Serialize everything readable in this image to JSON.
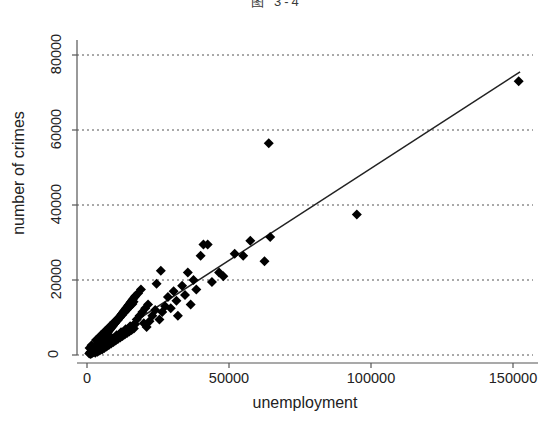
{
  "figure": {
    "title_cropped": "图 3-4",
    "background_color": "#ffffff",
    "marker_color": "#000000",
    "line_color": "#222222",
    "grid_color": "#555555"
  },
  "chart_data": {
    "type": "scatter",
    "title": "图 3-4",
    "xlabel": "unemployment",
    "ylabel": "number of crimes",
    "xlim": [
      -4000,
      160000
    ],
    "ylim": [
      -3500,
      85000
    ],
    "xticks": [
      0,
      50000,
      100000,
      150000
    ],
    "xtick_labels": [
      "0",
      "50000",
      "100000",
      "150000"
    ],
    "yticks": [
      0,
      20000,
      40000,
      60000,
      80000
    ],
    "ytick_labels": [
      "0",
      "20000",
      "40000",
      "60000",
      "80000"
    ],
    "grid": "horizontal-dashed",
    "legend": null,
    "marker": "diamond",
    "marker_size": 5,
    "series": [
      {
        "name": "observations",
        "points": [
          [
            800,
            400
          ],
          [
            1100,
            600
          ],
          [
            1300,
            300
          ],
          [
            1500,
            900
          ],
          [
            1700,
            500
          ],
          [
            1900,
            1200
          ],
          [
            2100,
            700
          ],
          [
            2300,
            1500
          ],
          [
            2500,
            1000
          ],
          [
            2700,
            1800
          ],
          [
            2900,
            600
          ],
          [
            3100,
            2100
          ],
          [
            3300,
            1400
          ],
          [
            3500,
            2400
          ],
          [
            3700,
            900
          ],
          [
            3900,
            2800
          ],
          [
            4100,
            1700
          ],
          [
            4300,
            3100
          ],
          [
            4500,
            1200
          ],
          [
            4700,
            3500
          ],
          [
            4900,
            2200
          ],
          [
            5100,
            3800
          ],
          [
            5300,
            1500
          ],
          [
            5500,
            4200
          ],
          [
            5700,
            2600
          ],
          [
            5900,
            4600
          ],
          [
            6100,
            1900
          ],
          [
            6300,
            5000
          ],
          [
            6500,
            3000
          ],
          [
            6700,
            5400
          ],
          [
            6900,
            2300
          ],
          [
            7100,
            5800
          ],
          [
            7300,
            3400
          ],
          [
            7500,
            6200
          ],
          [
            7700,
            2700
          ],
          [
            7900,
            6600
          ],
          [
            8100,
            3800
          ],
          [
            8300,
            7000
          ],
          [
            8500,
            3100
          ],
          [
            8700,
            7400
          ],
          [
            8900,
            4200
          ],
          [
            9100,
            7800
          ],
          [
            9300,
            3500
          ],
          [
            9500,
            8200
          ],
          [
            9700,
            4600
          ],
          [
            9900,
            8600
          ],
          [
            10100,
            3900
          ],
          [
            10300,
            9000
          ],
          [
            10500,
            5000
          ],
          [
            10700,
            9400
          ],
          [
            10900,
            4300
          ],
          [
            11100,
            9800
          ],
          [
            11300,
            5400
          ],
          [
            11500,
            10200
          ],
          [
            11700,
            4700
          ],
          [
            11900,
            10600
          ],
          [
            12100,
            5800
          ],
          [
            12300,
            11000
          ],
          [
            12500,
            5100
          ],
          [
            12700,
            11400
          ],
          [
            12900,
            6200
          ],
          [
            13100,
            11800
          ],
          [
            13300,
            5500
          ],
          [
            13500,
            12200
          ],
          [
            13700,
            6600
          ],
          [
            13900,
            12600
          ],
          [
            14100,
            5900
          ],
          [
            14300,
            13000
          ],
          [
            14500,
            7000
          ],
          [
            14700,
            13400
          ],
          [
            14900,
            6300
          ],
          [
            15100,
            13800
          ],
          [
            15300,
            7400
          ],
          [
            15500,
            14200
          ],
          [
            15700,
            6700
          ],
          [
            15900,
            14600
          ],
          [
            16100,
            7800
          ],
          [
            16300,
            15000
          ],
          [
            16500,
            7100
          ],
          [
            16700,
            15400
          ],
          [
            16900,
            8200
          ],
          [
            17100,
            15800
          ],
          [
            1200,
            800
          ],
          [
            2000,
            1600
          ],
          [
            2800,
            2300
          ],
          [
            3600,
            3000
          ],
          [
            4400,
            3700
          ],
          [
            5200,
            4400
          ],
          [
            6000,
            5100
          ],
          [
            6800,
            5800
          ],
          [
            7600,
            6500
          ],
          [
            8400,
            7200
          ],
          [
            9200,
            7900
          ],
          [
            10000,
            8600
          ],
          [
            10800,
            9300
          ],
          [
            11600,
            10000
          ],
          [
            12400,
            10700
          ],
          [
            13200,
            11400
          ],
          [
            14000,
            12100
          ],
          [
            14800,
            12800
          ],
          [
            15600,
            13500
          ],
          [
            16400,
            14200
          ],
          [
            900,
            1900
          ],
          [
            1600,
            2600
          ],
          [
            2400,
            1100
          ],
          [
            3200,
            4000
          ],
          [
            4000,
            2000
          ],
          [
            4800,
            5200
          ],
          [
            5600,
            2900
          ],
          [
            6400,
            6400
          ],
          [
            7200,
            3600
          ],
          [
            8000,
            7600
          ],
          [
            8800,
            4500
          ],
          [
            9600,
            8800
          ],
          [
            10400,
            5300
          ],
          [
            11200,
            10000
          ],
          [
            12000,
            6100
          ],
          [
            12800,
            11200
          ],
          [
            13600,
            6900
          ],
          [
            14400,
            12400
          ],
          [
            15200,
            7700
          ],
          [
            16000,
            13600
          ],
          [
            17500,
            9500
          ],
          [
            18000,
            16500
          ],
          [
            18500,
            10500
          ],
          [
            19000,
            17500
          ],
          [
            19500,
            11500
          ],
          [
            20000,
            8500
          ],
          [
            20500,
            12500
          ],
          [
            21000,
            7500
          ],
          [
            21500,
            13500
          ],
          [
            22000,
            9000
          ],
          [
            23000,
            10500
          ],
          [
            24000,
            12000
          ],
          [
            24500,
            19000
          ],
          [
            25500,
            9500
          ],
          [
            26000,
            22500
          ],
          [
            26500,
            11500
          ],
          [
            27500,
            13000
          ],
          [
            28500,
            15500
          ],
          [
            29500,
            12500
          ],
          [
            30500,
            17000
          ],
          [
            31500,
            14500
          ],
          [
            32000,
            10500
          ],
          [
            33500,
            18500
          ],
          [
            34500,
            16000
          ],
          [
            35500,
            22000
          ],
          [
            36500,
            13500
          ],
          [
            37500,
            20000
          ],
          [
            38500,
            17500
          ],
          [
            40000,
            26500
          ],
          [
            41000,
            29500
          ],
          [
            42500,
            29500
          ],
          [
            44000,
            19500
          ],
          [
            46500,
            22000
          ],
          [
            48000,
            21000
          ],
          [
            52000,
            27000
          ],
          [
            55000,
            26500
          ],
          [
            57500,
            30500
          ],
          [
            62500,
            25000
          ],
          [
            64000,
            56500
          ],
          [
            64500,
            31500
          ],
          [
            95000,
            37500
          ],
          [
            152000,
            73000
          ]
        ]
      }
    ],
    "fit_line": {
      "name": "linear fit",
      "x_start": 1000,
      "y_start": 1200,
      "x_end": 152500,
      "y_end": 75500
    }
  }
}
